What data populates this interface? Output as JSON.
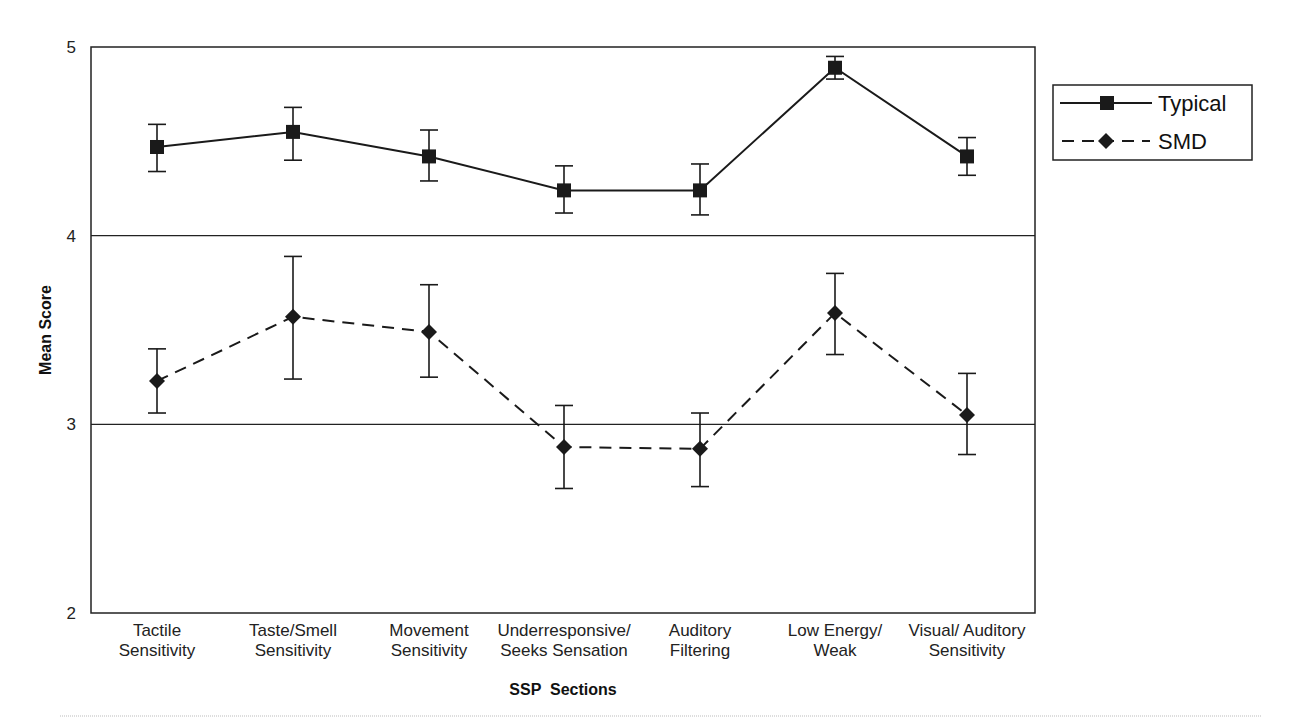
{
  "chart_data": {
    "type": "line",
    "title": "",
    "xlabel": "SSP  Sections",
    "ylabel": "Mean Score",
    "ylim": [
      2,
      5
    ],
    "yticks": [
      2,
      3,
      4,
      5
    ],
    "grid": {
      "horizontal": true,
      "vertical": false
    },
    "legend_position": "right",
    "categories": [
      [
        "Tactile",
        "Sensitivity"
      ],
      [
        "Taste/Smell",
        "Sensitivity"
      ],
      [
        "Movement",
        "Sensitivity"
      ],
      [
        "Underresponsive/",
        "Seeks Sensation"
      ],
      [
        "Auditory",
        "Filtering"
      ],
      [
        "Low Energy/",
        "Weak"
      ],
      [
        "Visual/ Auditory",
        "Sensitivity"
      ]
    ],
    "series": [
      {
        "name": "Typical",
        "line": "solid",
        "marker": "square",
        "values": [
          4.47,
          4.55,
          4.42,
          4.24,
          4.24,
          4.89,
          4.42
        ],
        "error_upper": [
          4.59,
          4.68,
          4.56,
          4.37,
          4.38,
          4.95,
          4.52
        ],
        "error_lower": [
          4.34,
          4.4,
          4.29,
          4.12,
          4.11,
          4.83,
          4.32
        ]
      },
      {
        "name": "SMD",
        "line": "dashed",
        "marker": "diamond",
        "values": [
          3.23,
          3.57,
          3.49,
          2.88,
          2.87,
          3.59,
          3.05
        ],
        "error_upper": [
          3.4,
          3.89,
          3.74,
          3.1,
          3.06,
          3.8,
          3.27
        ],
        "error_lower": [
          3.06,
          3.24,
          3.25,
          2.66,
          2.67,
          3.37,
          2.84
        ]
      }
    ],
    "colors": {
      "line": "#1a1a1a",
      "background": "#ffffff"
    }
  },
  "labels": {
    "ylabel": "Mean Score",
    "xlabel": "SSP  Sections",
    "legend_typical": "Typical",
    "legend_smd": "SMD"
  }
}
